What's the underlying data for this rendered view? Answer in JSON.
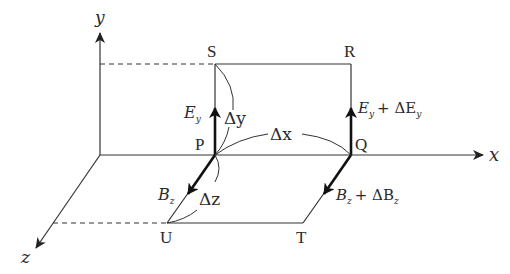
{
  "diagram": {
    "title": "",
    "axes": {
      "x_label": "x",
      "y_label": "y",
      "z_label": "z"
    },
    "points": {
      "P": "P",
      "Q": "Q",
      "R": "R",
      "S": "S",
      "T": "T",
      "U": "U"
    },
    "intervals": {
      "dx": "Δx",
      "dy": "Δy",
      "dz": "Δz"
    },
    "vectors": {
      "Ey_base": "E",
      "Ey_sub": "y",
      "Ey_plus": "+ ΔE",
      "Bz_base": "B",
      "Bz_sub": "z",
      "Bz_plus": "+ ΔB"
    },
    "colors": {
      "line": "#3a3a3a",
      "vector": "#111111",
      "text": "#2a2a2a"
    }
  }
}
